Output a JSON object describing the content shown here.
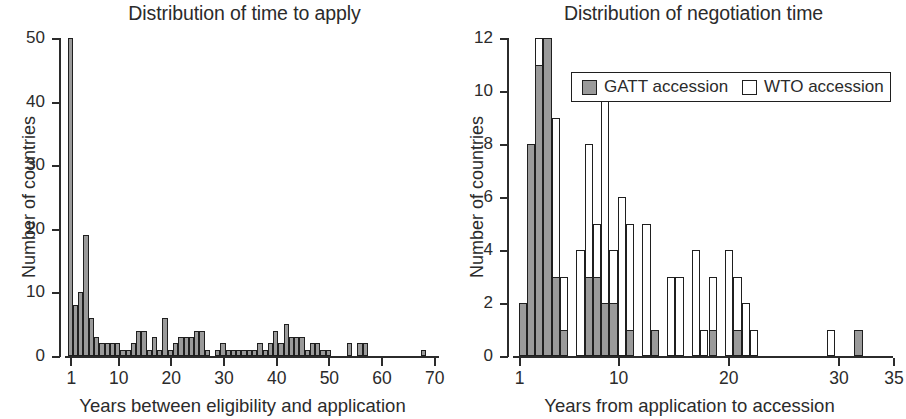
{
  "figure": {
    "width": 906,
    "height": 419,
    "background": "#ffffff",
    "bar_fill_gray": "#9a9a9a",
    "bar_fill_white": "#ffffff",
    "bar_stroke": "#1f1f1f",
    "text_color": "#2b2b2b"
  },
  "chart_data": [
    {
      "type": "bar",
      "id": "time-to-apply",
      "title": "Distribution of time to apply",
      "xlabel": "Years between eligibility and application",
      "ylabel": "Number of countries",
      "grid": false,
      "legend": null,
      "xlim": [
        0,
        71
      ],
      "ylim": [
        0,
        50
      ],
      "xticks": [
        1,
        10,
        20,
        30,
        40,
        50,
        60,
        70
      ],
      "xtick_labels": [
        "1",
        "10",
        "20",
        "30",
        "40",
        "50",
        "60",
        "70"
      ],
      "yticks": [
        0,
        10,
        20,
        30,
        40,
        50
      ],
      "ytick_labels": [
        "0",
        "10",
        "20",
        "30",
        "40",
        "50"
      ],
      "bin_width": 1,
      "x": [
        1,
        2,
        3,
        4,
        5,
        6,
        7,
        8,
        9,
        10,
        11,
        12,
        13,
        14,
        15,
        16,
        17,
        18,
        19,
        20,
        21,
        22,
        23,
        24,
        25,
        26,
        27,
        28,
        29,
        30,
        31,
        32,
        33,
        34,
        35,
        36,
        37,
        38,
        39,
        40,
        41,
        42,
        43,
        44,
        45,
        46,
        47,
        48,
        49,
        50,
        51,
        52,
        53,
        54,
        55,
        56,
        57,
        58,
        59,
        60,
        61,
        62,
        63,
        64,
        65,
        66,
        67,
        68,
        69,
        70
      ],
      "values": [
        50,
        8,
        10,
        19,
        6,
        3,
        2,
        2,
        2,
        2,
        1,
        1,
        2,
        4,
        4,
        1,
        3,
        1,
        6,
        1,
        2,
        3,
        3,
        3,
        4,
        4,
        1,
        0,
        1,
        2,
        1,
        1,
        1,
        1,
        1,
        1,
        2,
        1,
        2,
        4,
        2,
        5,
        3,
        3,
        3,
        1,
        2,
        2,
        1,
        1,
        0,
        0,
        0,
        2,
        0,
        2,
        2,
        0,
        0,
        0,
        0,
        0,
        0,
        0,
        0,
        0,
        0,
        1,
        0,
        0
      ]
    },
    {
      "type": "bar",
      "id": "negotiation-time",
      "title": "Distribution of negotiation time",
      "xlabel": "Years from application to accession",
      "ylabel": "Number of countries",
      "grid": false,
      "legend_position": "top-right",
      "xlim": [
        0.5,
        35
      ],
      "ylim": [
        0,
        12
      ],
      "xticks": [
        1,
        10,
        20,
        30,
        35
      ],
      "xtick_labels": [
        "1",
        "10",
        "20",
        "30",
        "35"
      ],
      "yticks": [
        0,
        2,
        4,
        6,
        8,
        10,
        12
      ],
      "ytick_labels": [
        "0",
        "2",
        "4",
        "6",
        "8",
        "10",
        "12"
      ],
      "bin_width": 0.75,
      "series": [
        {
          "name": "GATT accession",
          "color": "#9a9a9a",
          "x": [
            1,
            1.75,
            2.5,
            3.25,
            4,
            4.75,
            5.5,
            6.25,
            7,
            7.75,
            8.5,
            9.25,
            10,
            10.75,
            11.5,
            12.25,
            13,
            13.75,
            14.5,
            15.25,
            16,
            16.75,
            17.5,
            18.25,
            19,
            19.75,
            20.5,
            21.25,
            22,
            22.75,
            29,
            31.5
          ],
          "values": [
            2,
            8,
            11,
            12,
            3,
            1,
            0,
            0,
            3,
            3,
            2,
            2,
            0,
            1,
            0,
            0,
            1,
            0,
            0,
            0,
            0,
            0,
            0,
            1,
            0,
            0,
            1,
            0,
            0,
            0,
            0,
            1
          ]
        },
        {
          "name": "WTO accession",
          "color": "#ffffff",
          "x": [
            1,
            1.75,
            2.5,
            3.25,
            4,
            4.75,
            5.5,
            6.25,
            7,
            7.75,
            8.5,
            9.25,
            10,
            10.75,
            11.5,
            12.25,
            13,
            13.75,
            14.5,
            15.25,
            16,
            16.75,
            17.5,
            18.25,
            19,
            19.75,
            20.5,
            21.25,
            22,
            22.75,
            29,
            31.5
          ],
          "values": [
            0,
            0,
            1,
            0,
            6,
            2,
            0,
            4,
            5,
            2,
            8,
            2,
            6,
            4,
            0,
            5,
            0,
            0,
            3,
            3,
            0,
            4,
            1,
            2,
            0,
            4,
            2,
            2,
            1,
            0,
            1,
            0
          ]
        }
      ]
    }
  ],
  "legend": {
    "entries": [
      {
        "label": "GATT accession",
        "swatch": "gray"
      },
      {
        "label": "WTO accession",
        "swatch": "white"
      }
    ]
  }
}
